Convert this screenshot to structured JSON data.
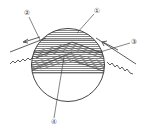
{
  "diagram": {
    "type": "sphere cross-section with layered hatching",
    "colors": {
      "stroke": "#333333",
      "hatch": "#555555",
      "background": "#ffffff"
    },
    "labels": [
      {
        "id": "label-1",
        "text": "①",
        "x": 97,
        "y": 11
      },
      {
        "id": "label-2",
        "text": "②",
        "x": 27,
        "y": 13
      },
      {
        "id": "label-3",
        "text": "③",
        "x": 134,
        "y": 42
      },
      {
        "id": "label-4",
        "text": "④",
        "x": 54,
        "y": 122
      }
    ]
  }
}
